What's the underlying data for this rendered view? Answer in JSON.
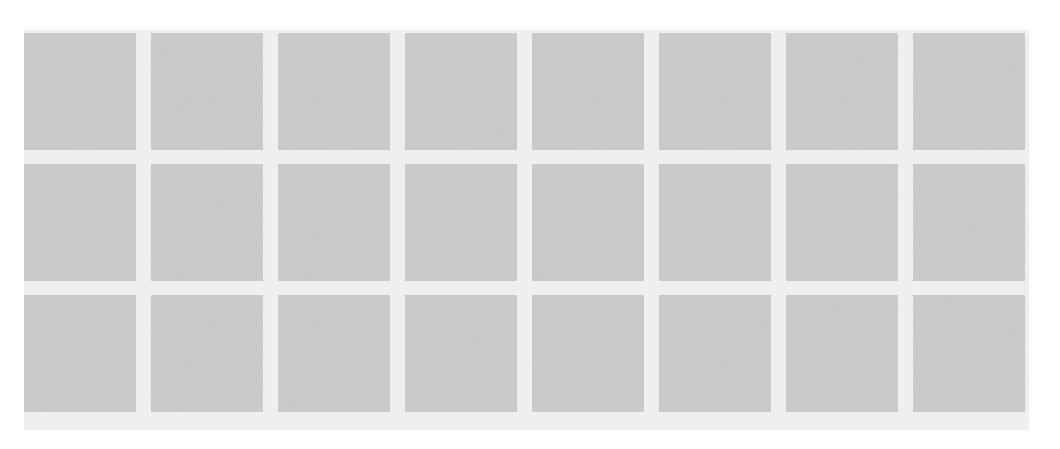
{
  "image": {
    "description": "Grid of gray speckled noise-texture swatches on a light gray background",
    "grid": {
      "rows": 3,
      "columns": 8
    },
    "colors": {
      "background": "#ffffff",
      "panel": "#efefef",
      "tile_base": "#b4b4b4"
    },
    "tiles": [
      {
        "row": 0,
        "col": 0
      },
      {
        "row": 0,
        "col": 1
      },
      {
        "row": 0,
        "col": 2
      },
      {
        "row": 0,
        "col": 3
      },
      {
        "row": 0,
        "col": 4
      },
      {
        "row": 0,
        "col": 5
      },
      {
        "row": 0,
        "col": 6
      },
      {
        "row": 0,
        "col": 7
      },
      {
        "row": 1,
        "col": 0
      },
      {
        "row": 1,
        "col": 1
      },
      {
        "row": 1,
        "col": 2
      },
      {
        "row": 1,
        "col": 3
      },
      {
        "row": 1,
        "col": 4
      },
      {
        "row": 1,
        "col": 5
      },
      {
        "row": 1,
        "col": 6
      },
      {
        "row": 1,
        "col": 7
      },
      {
        "row": 2,
        "col": 0
      },
      {
        "row": 2,
        "col": 1
      },
      {
        "row": 2,
        "col": 2
      },
      {
        "row": 2,
        "col": 3
      },
      {
        "row": 2,
        "col": 4
      },
      {
        "row": 2,
        "col": 5
      },
      {
        "row": 2,
        "col": 6
      },
      {
        "row": 2,
        "col": 7
      }
    ]
  }
}
